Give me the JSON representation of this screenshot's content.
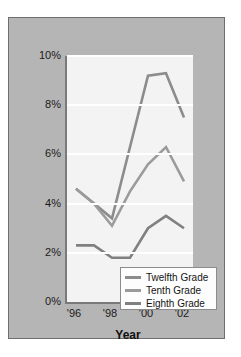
{
  "chart_data": {
    "type": "line",
    "title": "",
    "xlabel": "Year",
    "ylabel": "",
    "x": [
      1996,
      1997,
      1998,
      1999,
      2000,
      2001,
      2002
    ],
    "xtick_labels": [
      "'96",
      "'98",
      "'00",
      "'02"
    ],
    "xtick_values": [
      1996,
      1998,
      2000,
      2002
    ],
    "ytick_labels": [
      "0%",
      "2%",
      "4%",
      "6%",
      "8%",
      "10%"
    ],
    "ytick_values": [
      0,
      2,
      4,
      6,
      8,
      10
    ],
    "ylim": [
      0,
      10
    ],
    "xlim": [
      1996,
      2002
    ],
    "grid": "horizontal",
    "legend_position": "lower-right-inside",
    "series": [
      {
        "name": "Twelfth Grade",
        "color": "#8c8c8c",
        "values": [
          4.6,
          4.0,
          3.4,
          6.3,
          9.2,
          9.3,
          7.5
        ]
      },
      {
        "name": "Tenth Grade",
        "color": "#9b9b9b",
        "values": [
          4.6,
          4.0,
          3.1,
          4.5,
          5.6,
          6.3,
          4.9
        ]
      },
      {
        "name": "Eighth Grade",
        "color": "#808080",
        "values": [
          2.3,
          2.3,
          1.8,
          1.8,
          3.0,
          3.5,
          3.0
        ]
      }
    ]
  },
  "axis": {
    "x_title": "Year"
  },
  "legend": {
    "items": [
      {
        "label": "Twelfth Grade",
        "color": "#8c8c8c"
      },
      {
        "label": "Tenth Grade",
        "color": "#9b9b9b"
      },
      {
        "label": "Eighth Grade",
        "color": "#808080"
      }
    ]
  },
  "colors": {
    "panel_background": "#b5b5b5",
    "panel_border": "#6f6f6f",
    "plot_background": "#f3f3f3",
    "gridline": "#ffffff",
    "axis_line": "#7a7a7a",
    "text": "#1a1a1a"
  }
}
